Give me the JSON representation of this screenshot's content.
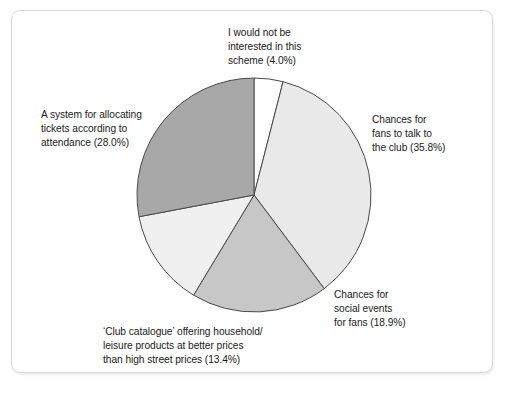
{
  "figure": {
    "frame_border_color": "#d8d8d8",
    "background_color": "#ffffff"
  },
  "chart_data": {
    "type": "pie",
    "title": "",
    "subtitle": "",
    "xlabel": "",
    "ylabel": "",
    "legend_position": "none",
    "grid": false,
    "labels_placement": "outside-callout-free",
    "start_angle_deg": 0,
    "direction": "clockwise",
    "total_percent": 100.1,
    "categories": [
      "I would not be interested in this scheme",
      "Chances for fans to talk to the club",
      "Chances for social events for fans",
      "'Club catalogue' offering household/ leisure products at better prices than high street prices",
      "A system for allocating tickets according to attendance"
    ],
    "values": [
      4.0,
      35.8,
      18.9,
      13.4,
      28.0
    ],
    "value_unit": "%",
    "colors": [
      "#ffffff",
      "#e9e9e9",
      "#c7c7c7",
      "#f0f0f0",
      "#a8a8a8"
    ],
    "slice_edge_color": "#4a4a4a",
    "slices": [
      {
        "label_text": "I would not be\ninterested in this\nscheme (4.0%)",
        "name": "I would not be interested in this scheme",
        "value": 4.0,
        "color": "#ffffff"
      },
      {
        "label_text": "Chances for\nfans to talk to\nthe club (35.8%)",
        "name": "Chances for fans to talk to the club",
        "value": 35.8,
        "color": "#e9e9e9"
      },
      {
        "label_text": "Chances for\nsocial events\nfor fans (18.9%)",
        "name": "Chances for social events for fans",
        "value": 18.9,
        "color": "#c7c7c7"
      },
      {
        "label_text": "‘Club catalogue’ offering household/\nleisure products at better prices\nthan high street prices (13.4%)",
        "name": "'Club catalogue' offering household/leisure products at better prices than high street prices",
        "value": 13.4,
        "color": "#f0f0f0"
      },
      {
        "label_text": "A system for allocating\ntickets according to\nattendance (28.0%)",
        "name": "A system for allocating tickets according to attendance",
        "value": 28.0,
        "color": "#a8a8a8"
      }
    ]
  }
}
